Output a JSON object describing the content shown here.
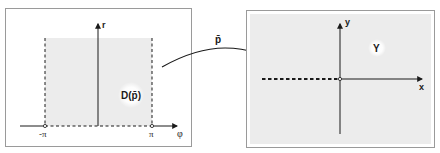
{
  "diagram": {
    "left_panel": {
      "name": "domain-panel",
      "axis_vertical_label": "r",
      "axis_horizontal_label": "φ",
      "tick_left_label": "-π",
      "tick_right_label": "π",
      "region_label": "D(p̄)",
      "region_fill": "#ececec",
      "border_color": "#9a9a9a"
    },
    "mapping": {
      "label": "p̄",
      "direction": "left-to-right"
    },
    "right_panel": {
      "name": "image-panel",
      "axis_vertical_label": "y",
      "axis_horizontal_label": "x",
      "region_label": "Y",
      "region_fill": "#ececec",
      "border_color": "#9a9a9a",
      "excluded_ray": "negative x-axis (dashed)"
    }
  }
}
